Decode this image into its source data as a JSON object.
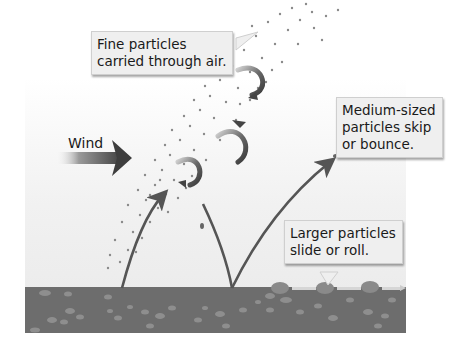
{
  "diagram": {
    "type": "wind-erosion-particle-transport",
    "callouts": {
      "fine": {
        "lines": [
          "Fine particles",
          "carried through air."
        ]
      },
      "medium": {
        "lines": [
          "Medium-sized",
          "particles skip",
          "or bounce."
        ]
      },
      "large": {
        "lines": [
          "Larger particles",
          "slide or roll."
        ]
      }
    },
    "wind_label": "Wind",
    "colors": {
      "ground": "#6d6d6d",
      "pebble": "#8e8e8e",
      "arrow": "#555555",
      "particle": "#8a8a8a",
      "callout_bg": "#efefef",
      "text": "#1a1a1a"
    },
    "processes": [
      "suspension",
      "saltation",
      "surface creep"
    ]
  }
}
